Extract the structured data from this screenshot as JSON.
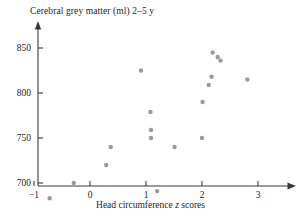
{
  "chart_data": {
    "type": "scatter",
    "title": "Cerebral grey matter (ml) 2–5 y",
    "xlabel": "Head circumference z scores",
    "xlabel_parts": {
      "pre": "Head circumference ",
      "italic": "z",
      "post": " scores"
    },
    "ylabel": "",
    "xlim": [
      -1.35,
      3.45
    ],
    "ylim": [
      672,
      868
    ],
    "xticks": [
      -1,
      0,
      1,
      2,
      3
    ],
    "xticklabels": [
      "−1",
      "0",
      "1",
      "2",
      "3"
    ],
    "yticks": [
      700,
      750,
      800,
      850
    ],
    "yticklabels": [
      "700",
      "750",
      "800",
      "850"
    ],
    "grid": false,
    "legend": null,
    "marker_color": "#9a9a9a",
    "axis_color": "#3a3a3a",
    "points": [
      {
        "x": -0.72,
        "y": 683
      },
      {
        "x": -0.29,
        "y": 700
      },
      {
        "x": 0.29,
        "y": 720
      },
      {
        "x": 0.37,
        "y": 740
      },
      {
        "x": 0.91,
        "y": 825
      },
      {
        "x": 1.08,
        "y": 779
      },
      {
        "x": 1.09,
        "y": 759
      },
      {
        "x": 1.09,
        "y": 750
      },
      {
        "x": 1.2,
        "y": 691
      },
      {
        "x": 1.51,
        "y": 740
      },
      {
        "x": 2.0,
        "y": 750
      },
      {
        "x": 2.01,
        "y": 790
      },
      {
        "x": 2.12,
        "y": 809
      },
      {
        "x": 2.17,
        "y": 818
      },
      {
        "x": 2.19,
        "y": 845
      },
      {
        "x": 2.28,
        "y": 840
      },
      {
        "x": 2.33,
        "y": 836
      },
      {
        "x": 2.81,
        "y": 815
      }
    ]
  }
}
